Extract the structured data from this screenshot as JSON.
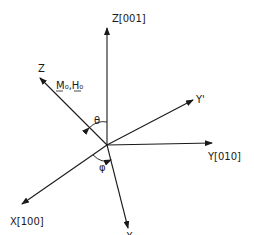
{
  "diagram": {
    "type": "coordinate-axes",
    "origin": [
      107,
      145
    ],
    "axes": [
      {
        "id": "z001",
        "label": "Z[001]",
        "end": [
          107,
          28
        ],
        "label_pos": [
          112,
          22
        ]
      },
      {
        "id": "zprime",
        "label": "Z",
        "end": [
          40,
          78
        ],
        "label_pos": [
          38,
          72
        ]
      },
      {
        "id": "yprime",
        "label": "Y'",
        "end": [
          193,
          100
        ],
        "label_pos": [
          196,
          103
        ]
      },
      {
        "id": "y010",
        "label": "Y[010]",
        "end": [
          212,
          143
        ],
        "label_pos": [
          208,
          160
        ]
      },
      {
        "id": "x100",
        "label": "X[100]",
        "end": [
          22,
          204
        ],
        "label_pos": [
          10,
          225
        ]
      },
      {
        "id": "xprime",
        "label": "X",
        "end": [
          128,
          228
        ],
        "label_pos": [
          126,
          240
        ]
      }
    ],
    "vector_label": "M₀,H₀",
    "vector_label_pos": [
      56,
      89
    ],
    "angles": [
      {
        "symbol": "θ",
        "label_pos": [
          94,
          124
        ]
      },
      {
        "symbol": "φ",
        "label_pos": [
          99,
          171
        ]
      }
    ]
  }
}
